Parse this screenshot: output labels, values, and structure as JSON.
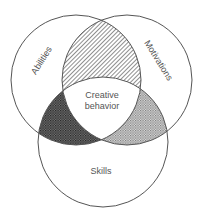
{
  "diagram": {
    "type": "venn",
    "circles": [
      {
        "id": "abilities",
        "label": "Abilities",
        "cx": 76,
        "cy": 80,
        "r": 65
      },
      {
        "id": "motivations",
        "label": "Motivations",
        "cx": 127,
        "cy": 80,
        "r": 65
      },
      {
        "id": "skills",
        "label": "Skills",
        "cx": 103,
        "cy": 142,
        "r": 65
      }
    ],
    "center_label_line1": "Creative",
    "center_label_line2": "behavior",
    "colors": {
      "stroke": "#555555",
      "fill": "#ffffff",
      "hatch": "#444444"
    }
  }
}
